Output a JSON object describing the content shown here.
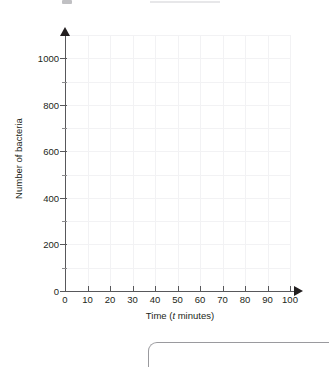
{
  "chart_data": {
    "type": "line",
    "title": "",
    "subtitle": "",
    "xlabel_prefix": "Time (",
    "xlabel_variable": "t",
    "xlabel_suffix": " minutes)",
    "xlabel": "Time (t minutes)",
    "ylabel": "Number of bacteria",
    "xlim": [
      0,
      100
    ],
    "ylim": [
      0,
      1100
    ],
    "x_major_ticks": [
      0,
      10,
      20,
      30,
      40,
      50,
      60,
      70,
      80,
      90,
      100
    ],
    "x_tick_labels": [
      "0",
      "10",
      "20",
      "30",
      "40",
      "50",
      "60",
      "70",
      "80",
      "90",
      "100"
    ],
    "y_major_ticks": [
      0,
      200,
      400,
      600,
      800,
      1000
    ],
    "y_tick_labels": [
      "0",
      "200",
      "400",
      "600",
      "800",
      "1000"
    ],
    "y_minor_ticks": [
      100,
      300,
      500,
      700,
      900
    ],
    "grid": true,
    "legend": null,
    "series": [],
    "values": [],
    "categories": [],
    "annotations": [],
    "note": "Empty grid provided for the student to plot points"
  },
  "axes": {
    "x_title_parts": {
      "prefix": "Time (",
      "variable": "t",
      "suffix": " minutes)"
    },
    "y_title": "Number of bacteria"
  },
  "colors": {
    "axis": "#58585b",
    "text": "#231f20",
    "grid": "#f2f2f4",
    "answer_box_border": "#9a9a9e",
    "background": "#ffffff"
  }
}
